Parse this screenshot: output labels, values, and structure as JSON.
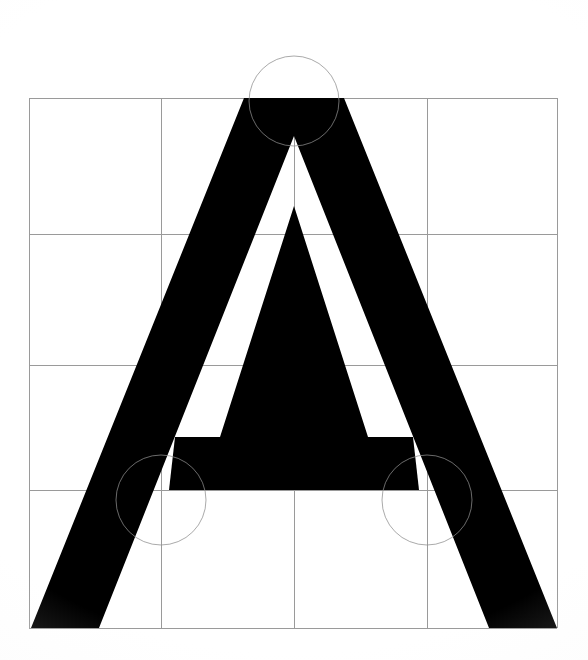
{
  "document": {
    "kind": "type-specimen-construction-drawing",
    "title": "",
    "glyph": "A",
    "background_color": "#ffffff",
    "glyph_color": "#000000",
    "grid_color": "#9a9a9a",
    "guide_circle_color": "#8d8d8d"
  },
  "canvas": {
    "width": 588,
    "height": 660
  },
  "grid": {
    "stroke_width": 1,
    "vertical_lines_x": [
      29,
      161,
      294,
      427,
      557
    ],
    "horizontal_lines_y": [
      98,
      234,
      365,
      490,
      628
    ],
    "left": 29,
    "right": 557,
    "top": 98,
    "bottom": 628,
    "columns": 4,
    "rows": 4
  },
  "guide_circles": [
    {
      "name": "apex-circle",
      "cx": 294,
      "cy": 101,
      "r": 45
    },
    {
      "name": "left-foot-circle",
      "cx": 161,
      "cy": 500,
      "r": 45
    },
    {
      "name": "right-foot-circle",
      "cx": 427,
      "cy": 500,
      "r": 45
    }
  ],
  "glyph_outline": {
    "name": "letter-a",
    "description": "Uppercase A, sans-serif, flat apex, no crossbar serifs",
    "outer": [
      [
        294,
        98
      ],
      [
        344,
        98
      ],
      [
        557,
        628
      ],
      [
        489,
        628
      ],
      [
        294,
        136
      ],
      [
        99,
        628
      ],
      [
        31,
        628
      ],
      [
        244,
        98
      ]
    ],
    "counter": [
      [
        294,
        206
      ],
      [
        368,
        437
      ],
      [
        220,
        437
      ]
    ],
    "crossbar": {
      "left_x": 175,
      "right_x": 413,
      "top_y": 437,
      "bottom_y": 490
    }
  },
  "labels": {
    "alt_text": "Construction grid drawing of the capital letter A"
  }
}
